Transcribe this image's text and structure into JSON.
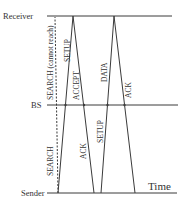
{
  "diagram": {
    "nodes": {
      "receiver": "Receiver",
      "bs": "BS",
      "sender": "Sender"
    },
    "axis_label": "Time",
    "messages": {
      "search_unreachable": "SEARCH (cannot reach)",
      "setup_1": "SETUP",
      "accept": "ACCEPT",
      "data": "DATA",
      "ack_1": "ACK",
      "search": "SEARCH",
      "ack_2": "ACK",
      "setup_2": "SETUP"
    },
    "colors": {
      "line": "#3a3a3a",
      "text": "#333333"
    }
  }
}
